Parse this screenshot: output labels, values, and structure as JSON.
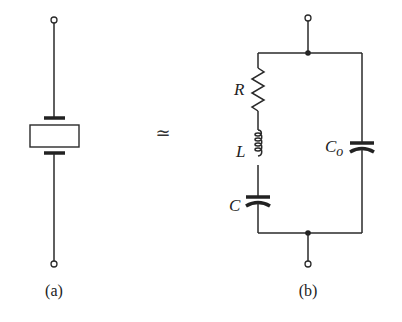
{
  "figure": {
    "panels": [
      {
        "id": "a",
        "caption": "(a)",
        "component": "crystal-resonator-symbol"
      },
      {
        "id": "b",
        "caption": "(b)",
        "component": "equivalent-circuit",
        "labels": {
          "resistor": "R",
          "inductor": "L",
          "series_capacitor": "C",
          "shunt_capacitor_main": "C",
          "shunt_capacitor_sub": "o"
        }
      }
    ],
    "relation_symbol": "≃"
  }
}
